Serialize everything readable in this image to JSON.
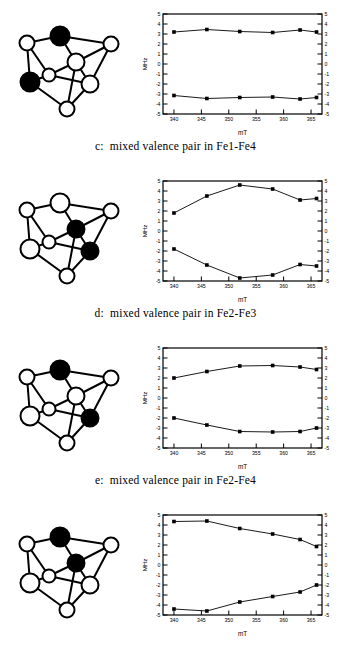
{
  "figure": {
    "axis_labels": {
      "x": "mT",
      "y": "MHz"
    },
    "y_ticks": [
      5,
      4,
      3,
      2,
      1,
      0,
      -1,
      -2,
      -3,
      -4,
      -5
    ],
    "x_ticks": [
      340,
      345,
      350,
      355,
      360,
      365
    ],
    "marker_color": "#000000",
    "line_color": "#000000",
    "frame_color": "#000000"
  },
  "panels": [
    {
      "id": "c",
      "caption": "c:  mixed valence pair in Fe1-Fe4",
      "cluster": {
        "filled_sites": [
          "top-center",
          "mid-left"
        ]
      },
      "chart_data": {
        "type": "line",
        "title": "c:  mixed valence pair in Fe1-Fe4",
        "xlabel": "mT",
        "ylabel": "MHz",
        "xlim": [
          338,
          367
        ],
        "ylim": [
          -5,
          5
        ],
        "grid": false,
        "legend": "none",
        "x": [
          340,
          346,
          352,
          358,
          363,
          366
        ],
        "series": [
          {
            "name": "upper branch",
            "values": [
              3.2,
              3.45,
              3.25,
              3.15,
              3.4,
              3.2
            ]
          },
          {
            "name": "lower branch",
            "values": [
              -3.15,
              -3.45,
              -3.35,
              -3.3,
              -3.5,
              -3.35
            ]
          }
        ]
      }
    },
    {
      "id": "d",
      "caption": "d:  mixed valence pair in Fe2-Fe3",
      "cluster": {
        "filled_sites": [
          "center-interior",
          "mid-right"
        ]
      },
      "chart_data": {
        "type": "line",
        "title": "d:  mixed valence pair in Fe2-Fe3",
        "xlabel": "mT",
        "ylabel": "MHz",
        "xlim": [
          338,
          367
        ],
        "ylim": [
          -5,
          5
        ],
        "grid": false,
        "legend": "none",
        "x": [
          340,
          346,
          352,
          358,
          363,
          366
        ],
        "series": [
          {
            "name": "upper branch",
            "values": [
              1.8,
              3.5,
              4.6,
              4.2,
              3.1,
              3.25
            ]
          },
          {
            "name": "lower branch",
            "values": [
              -1.8,
              -3.4,
              -4.7,
              -4.4,
              -3.35,
              -3.5
            ]
          }
        ]
      }
    },
    {
      "id": "e",
      "caption": "e:  mixed valence pair in Fe2-Fe4",
      "cluster": {
        "filled_sites": [
          "top-center",
          "mid-right"
        ]
      },
      "chart_data": {
        "type": "line",
        "title": "e:  mixed valence pair in Fe2-Fe4",
        "xlabel": "mT",
        "ylabel": "MHz",
        "xlim": [
          338,
          367
        ],
        "ylim": [
          -5,
          5
        ],
        "grid": false,
        "legend": "none",
        "x": [
          340,
          346,
          352,
          358,
          363,
          366
        ],
        "series": [
          {
            "name": "upper branch",
            "values": [
              2.0,
              2.65,
              3.2,
              3.25,
              3.1,
              2.85
            ]
          },
          {
            "name": "lower branch",
            "values": [
              -2.0,
              -2.7,
              -3.35,
              -3.4,
              -3.35,
              -3.0
            ]
          }
        ]
      }
    },
    {
      "id": "f",
      "caption": "f:  mixed valence pair in Fe3-Fe4",
      "cluster": {
        "filled_sites": [
          "top-center",
          "center-interior"
        ]
      },
      "chart_data": {
        "type": "line",
        "title": "f:  mixed valence pair in Fe3-Fe4",
        "xlabel": "mT",
        "ylabel": "MHz",
        "xlim": [
          338,
          367
        ],
        "ylim": [
          -5,
          5
        ],
        "grid": false,
        "legend": "none",
        "x": [
          340,
          346,
          352,
          358,
          363,
          366
        ],
        "series": [
          {
            "name": "upper branch",
            "values": [
              4.35,
              4.4,
              3.65,
              3.1,
              2.55,
              1.85
            ]
          },
          {
            "name": "lower branch",
            "values": [
              -4.4,
              -4.6,
              -3.7,
              -3.15,
              -2.7,
              -2.0
            ]
          }
        ]
      }
    }
  ]
}
